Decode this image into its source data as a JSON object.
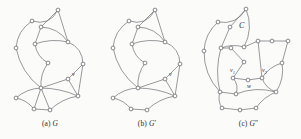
{
  "figure": {
    "background_color": "#fbfbfa",
    "edge_color": "#6e6e73",
    "node_fill": "#ffffff",
    "node_stroke": "#58585c",
    "label_color": "#2e2e31",
    "width": 301,
    "height": 139
  },
  "panels": [
    {
      "id": "a",
      "caption_prefix": "(a)",
      "caption_symbol": "G",
      "caption_prime": "",
      "caption_full": "(a) G",
      "vertex_labels": [
        {
          "text": "v",
          "sub": "",
          "x": 72,
          "y": 76
        }
      ],
      "region_labels": []
    },
    {
      "id": "b",
      "caption_prefix": "(b)",
      "caption_symbol": "G",
      "caption_prime": "′",
      "caption_full": "(b) G′",
      "vertex_labels": [
        {
          "text": "v",
          "sub": "",
          "x": 72,
          "y": 76
        }
      ],
      "region_labels": []
    },
    {
      "id": "c",
      "caption_prefix": "(c)",
      "caption_symbol": "G",
      "caption_prime": "″",
      "caption_full": "(c) G″",
      "vertex_labels": [
        {
          "text": "v",
          "sub": "1",
          "x": 34,
          "y": 72
        },
        {
          "text": "v",
          "sub": "2",
          "x": 66,
          "y": 72
        },
        {
          "text": "w",
          "sub": "",
          "x": 51,
          "y": 88
        }
      ],
      "region_labels": [
        {
          "text": "C",
          "x": 43,
          "y": 28
        }
      ]
    }
  ],
  "graph_a": {
    "nodes": [
      {
        "id": "n0",
        "x": 58,
        "y": 10
      },
      {
        "id": "n1",
        "x": 32,
        "y": 21
      },
      {
        "id": "n2",
        "x": 41,
        "y": 27
      },
      {
        "id": "n3",
        "x": 16,
        "y": 48
      },
      {
        "id": "n4",
        "x": 35,
        "y": 44
      },
      {
        "id": "n5",
        "x": 68,
        "y": 42
      },
      {
        "id": "n6",
        "x": 48,
        "y": 63
      },
      {
        "id": "n7",
        "x": 83,
        "y": 64
      },
      {
        "id": "n8",
        "x": 68,
        "y": 79
      },
      {
        "id": "n9",
        "x": 41,
        "y": 88
      },
      {
        "id": "n10",
        "x": 78,
        "y": 96
      },
      {
        "id": "n11",
        "x": 16,
        "y": 98
      },
      {
        "id": "n12",
        "x": 34,
        "y": 109
      },
      {
        "id": "n13",
        "x": 50,
        "y": 110
      }
    ],
    "edges": [
      {
        "from": "n0",
        "to": "n1",
        "curve": -12
      },
      {
        "from": "n0",
        "to": "n2",
        "curve": 0
      },
      {
        "from": "n0",
        "to": "n5",
        "curve": 0
      },
      {
        "from": "n1",
        "to": "n3",
        "curve": 8
      },
      {
        "from": "n2",
        "to": "n4",
        "curve": 0
      },
      {
        "from": "n2",
        "to": "n5",
        "curve": -8
      },
      {
        "from": "n4",
        "to": "n5",
        "curve": -5
      },
      {
        "from": "n4",
        "to": "n6",
        "curve": 6
      },
      {
        "from": "n5",
        "to": "n7",
        "curve": -9
      },
      {
        "from": "n3",
        "to": "n9",
        "curve": 9
      },
      {
        "from": "n6",
        "to": "n9",
        "curve": 5
      },
      {
        "from": "n7",
        "to": "n8",
        "curve": 0
      },
      {
        "from": "n7",
        "to": "n10",
        "curve": 0
      },
      {
        "from": "n8",
        "to": "n9",
        "curve": 0
      },
      {
        "from": "n8",
        "to": "n10",
        "curve": 0
      },
      {
        "from": "n9",
        "to": "n10",
        "curve": -4
      },
      {
        "from": "n9",
        "to": "n11",
        "curve": 5
      },
      {
        "from": "n9",
        "to": "n12",
        "curve": 0
      },
      {
        "from": "n9",
        "to": "n13",
        "curve": 0
      },
      {
        "from": "n11",
        "to": "n12",
        "curve": -4
      },
      {
        "from": "n12",
        "to": "n13",
        "curve": 0
      },
      {
        "from": "n13",
        "to": "n10",
        "curve": -5
      }
    ]
  },
  "graph_b": {
    "nodes": [
      {
        "id": "n0",
        "x": 58,
        "y": 10
      },
      {
        "id": "n1",
        "x": 32,
        "y": 21
      },
      {
        "id": "n2",
        "x": 41,
        "y": 27
      },
      {
        "id": "n3",
        "x": 16,
        "y": 48
      },
      {
        "id": "n4",
        "x": 35,
        "y": 44
      },
      {
        "id": "n5",
        "x": 68,
        "y": 42
      },
      {
        "id": "n6",
        "x": 48,
        "y": 63
      },
      {
        "id": "n7",
        "x": 83,
        "y": 64
      },
      {
        "id": "n8",
        "x": 68,
        "y": 79
      },
      {
        "id": "n9",
        "x": 41,
        "y": 88
      },
      {
        "id": "n10",
        "x": 78,
        "y": 96
      },
      {
        "id": "n11",
        "x": 16,
        "y": 98
      },
      {
        "id": "n12",
        "x": 34,
        "y": 109
      },
      {
        "id": "n13",
        "x": 50,
        "y": 110
      }
    ],
    "edges": [
      {
        "from": "n0",
        "to": "n1",
        "curve": -12
      },
      {
        "from": "n0",
        "to": "n2",
        "curve": 0
      },
      {
        "from": "n0",
        "to": "n5",
        "curve": 0
      },
      {
        "from": "n1",
        "to": "n3",
        "curve": 8
      },
      {
        "from": "n2",
        "to": "n4",
        "curve": 0
      },
      {
        "from": "n2",
        "to": "n5",
        "curve": -8
      },
      {
        "from": "n4",
        "to": "n5",
        "curve": -5
      },
      {
        "from": "n4",
        "to": "n6",
        "curve": 6
      },
      {
        "from": "n5",
        "to": "n7",
        "curve": -9
      },
      {
        "from": "n3",
        "to": "n9",
        "curve": 9
      },
      {
        "from": "n6",
        "to": "n9",
        "curve": 5
      },
      {
        "from": "n7",
        "to": "n8",
        "curve": 0
      },
      {
        "from": "n7",
        "to": "n10",
        "curve": 0
      },
      {
        "from": "n8",
        "to": "n9",
        "curve": 0
      },
      {
        "from": "n8",
        "to": "n10",
        "curve": 0
      },
      {
        "from": "n9",
        "to": "n10",
        "curve": -4
      },
      {
        "from": "n9",
        "to": "n11",
        "curve": 5
      },
      {
        "from": "n11",
        "to": "n12",
        "curve": -4
      },
      {
        "from": "n12",
        "to": "n13",
        "curve": 0
      },
      {
        "from": "n13",
        "to": "n10",
        "curve": -5
      }
    ]
  },
  "graph_c": {
    "nodes": [
      {
        "id": "n0",
        "x": 50,
        "y": 9
      },
      {
        "id": "n1",
        "x": 22,
        "y": 22
      },
      {
        "id": "n2",
        "x": 34,
        "y": 27
      },
      {
        "id": "n3",
        "x": 8,
        "y": 51
      },
      {
        "id": "n4",
        "x": 25,
        "y": 48
      },
      {
        "id": "n5",
        "x": 35,
        "y": 48
      },
      {
        "id": "n6",
        "x": 48,
        "y": 47
      },
      {
        "id": "n7",
        "x": 62,
        "y": 41
      },
      {
        "id": "n8",
        "x": 76,
        "y": 41
      },
      {
        "id": "n9",
        "x": 92,
        "y": 41
      },
      {
        "id": "n10",
        "x": 48,
        "y": 62
      },
      {
        "id": "n11",
        "x": 86,
        "y": 63
      },
      {
        "id": "n12",
        "x": 37,
        "y": 78
      },
      {
        "id": "n13",
        "x": 52,
        "y": 80
      },
      {
        "id": "n14",
        "x": 66,
        "y": 78
      },
      {
        "id": "n15",
        "x": 24,
        "y": 92
      },
      {
        "id": "n16",
        "x": 40,
        "y": 94
      },
      {
        "id": "n17",
        "x": 80,
        "y": 92
      },
      {
        "id": "n18",
        "x": 26,
        "y": 108
      },
      {
        "id": "n19",
        "x": 44,
        "y": 110
      },
      {
        "id": "n20",
        "x": 60,
        "y": 108
      }
    ],
    "edges": [
      {
        "from": "n0",
        "to": "n1",
        "curve": -11
      },
      {
        "from": "n0",
        "to": "n2",
        "curve": 0
      },
      {
        "from": "n0",
        "to": "n6",
        "curve": -9
      },
      {
        "from": "n1",
        "to": "n3",
        "curve": 7
      },
      {
        "from": "n2",
        "to": "n4",
        "curve": 0
      },
      {
        "from": "n4",
        "to": "n6",
        "curve": -4
      },
      {
        "from": "n4",
        "to": "n5",
        "curve": 0
      },
      {
        "from": "n5",
        "to": "n10",
        "curve": 0
      },
      {
        "from": "n6",
        "to": "n7",
        "curve": 0
      },
      {
        "from": "n7",
        "to": "n8",
        "curve": 0
      },
      {
        "from": "n8",
        "to": "n9",
        "curve": 0
      },
      {
        "from": "n9",
        "to": "n11",
        "curve": 0
      },
      {
        "from": "n7",
        "to": "n14",
        "curve": 0
      },
      {
        "from": "n10",
        "to": "n12",
        "curve": 0
      },
      {
        "from": "n3",
        "to": "n15",
        "curve": 9
      },
      {
        "from": "n4",
        "to": "n15",
        "curve": 6
      },
      {
        "from": "n12",
        "to": "n13",
        "curve": 0
      },
      {
        "from": "n13",
        "to": "n14",
        "curve": 0
      },
      {
        "from": "n11",
        "to": "n14",
        "curve": 5
      },
      {
        "from": "n11",
        "to": "n17",
        "curve": -6
      },
      {
        "from": "n12",
        "to": "n16",
        "curve": -5
      },
      {
        "from": "n15",
        "to": "n16",
        "curve": 0
      },
      {
        "from": "n16",
        "to": "n17",
        "curve": -7
      },
      {
        "from": "n14",
        "to": "n17",
        "curve": 5
      },
      {
        "from": "n15",
        "to": "n18",
        "curve": 4
      },
      {
        "from": "n18",
        "to": "n19",
        "curve": 0
      },
      {
        "from": "n19",
        "to": "n20",
        "curve": 0
      },
      {
        "from": "n20",
        "to": "n17",
        "curve": -4
      }
    ]
  }
}
